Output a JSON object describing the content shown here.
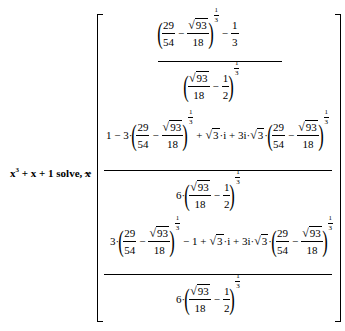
{
  "expression": {
    "lhs_base": "x",
    "lhs_power": "3",
    "lhs_rest": "+ x + 1",
    "keyword": "solve, x",
    "arrow": "→"
  },
  "result": {
    "type": "column-vector",
    "entries": [
      {
        "latex": "\\frac{\\left(\\frac{29}{54}-\\frac{\\sqrt{93}}{18}\\right)^{1/3}-\\frac{1}{3}}{\\left(\\frac{\\sqrt{93}}{18}-\\frac{1}{2}\\right)^{1/3}}",
        "num": {
          "f1n": "29",
          "f1d": "54",
          "minus": "−",
          "sqrt_arg": "93",
          "f2d": "18",
          "exp_n": "1",
          "exp_d": "3",
          "tail_op": "−",
          "tail_n": "1",
          "tail_d": "3"
        },
        "den": {
          "sqrt_arg": "93",
          "f1d": "18",
          "minus": "−",
          "f2n": "1",
          "f2d": "2",
          "exp_n": "1",
          "exp_d": "3"
        }
      },
      {
        "latex": "\\frac{1-3\\cdot\\left(\\frac{29}{54}-\\frac{\\sqrt{93}}{18}\\right)^{1/3}+\\sqrt{3}\\cdot i+3i\\cdot\\sqrt{3}\\cdot\\left(\\frac{29}{54}-\\frac{\\sqrt{93}}{18}\\right)^{1/3}}{6\\cdot\\left(\\frac{\\sqrt{93}}{18}-\\frac{1}{2}\\right)^{1/3}}",
        "num": {
          "lead": "1 − 3·",
          "f1n": "29",
          "f1d": "54",
          "minus": "−",
          "sqrt_arg": "93",
          "f2d": "18",
          "exp_n": "1",
          "exp_d": "3",
          "mid": "+",
          "sqrt3": "3",
          "mid2": "·i + 3i·",
          "sqrt3b": "3",
          "dot": "·"
        },
        "den": {
          "lead": "6·",
          "sqrt_arg": "93",
          "f1d": "18",
          "minus": "−",
          "f2n": "1",
          "f2d": "2",
          "exp_n": "1",
          "exp_d": "3"
        }
      },
      {
        "latex": "\\frac{3\\cdot\\left(\\frac{29}{54}-\\frac{\\sqrt{93}}{18}\\right)^{1/3}-1+\\sqrt{3}\\cdot i+3i\\cdot\\sqrt{3}\\cdot\\left(\\frac{29}{54}-\\frac{\\sqrt{93}}{18}\\right)^{1/3}}{6\\cdot\\left(\\frac{\\sqrt{93}}{18}-\\frac{1}{2}\\right)^{1/3}}",
        "num": {
          "lead": "3·",
          "f1n": "29",
          "f1d": "54",
          "minus": "−",
          "sqrt_arg": "93",
          "f2d": "18",
          "exp_n": "1",
          "exp_d": "3",
          "mid": "− 1 +",
          "sqrt3": "3",
          "mid2": "·i + 3i·",
          "sqrt3b": "3",
          "dot": "·"
        },
        "den": {
          "lead": "6·",
          "sqrt_arg": "93",
          "f1d": "18",
          "minus": "−",
          "f2n": "1",
          "f2d": "2",
          "exp_n": "1",
          "exp_d": "3"
        }
      }
    ]
  }
}
